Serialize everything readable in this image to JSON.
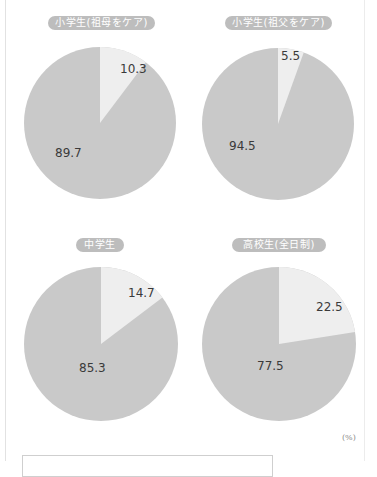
{
  "colors": {
    "majority": "#c9c9c9",
    "minority": "#eeeeee",
    "pill_bg": "#bdbdbd",
    "label_text": "#3a3a3a"
  },
  "unit_label": "(%)",
  "chart_data": [
    {
      "type": "pie",
      "title": "小学生(祖母をケア)",
      "categories": [
        "minority",
        "majority"
      ],
      "values": [
        10.3,
        89.7
      ],
      "labels": [
        "10.3",
        "89.7"
      ]
    },
    {
      "type": "pie",
      "title": "小学生(祖父をケア)",
      "categories": [
        "minority",
        "majority"
      ],
      "values": [
        5.5,
        94.5
      ],
      "labels": [
        "5.5",
        "94.5"
      ]
    },
    {
      "type": "pie",
      "title": "中学生",
      "categories": [
        "minority",
        "majority"
      ],
      "values": [
        14.7,
        85.3
      ],
      "labels": [
        "14.7",
        "85.3"
      ]
    },
    {
      "type": "pie",
      "title": "高校生(全日制)",
      "categories": [
        "minority",
        "majority"
      ],
      "values": [
        22.5,
        77.5
      ],
      "labels": [
        "22.5",
        "77.5"
      ]
    }
  ]
}
